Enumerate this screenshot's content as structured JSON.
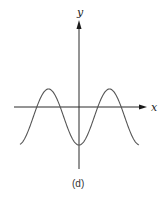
{
  "chart_data": {
    "type": "line",
    "title": "",
    "caption": "(d)",
    "xlabel": "x",
    "ylabel": "y",
    "grid": false,
    "legend": null,
    "series": [
      {
        "name": "y = -cos(x) shifted",
        "points_px": [
          [
            20,
            145
          ],
          [
            47,
            89
          ],
          [
            79,
            145
          ],
          [
            108,
            89
          ],
          [
            139,
            145
          ]
        ],
        "shape": "y = c - a*cos(x), minimum at x=0"
      }
    ],
    "pixel_geometry": {
      "y_axis_x": 79,
      "y_axis_top": 20,
      "y_axis_bottom": 169,
      "x_axis_y": 107,
      "x_axis_left": 14,
      "x_axis_right": 147,
      "wave_center_y": 117,
      "wave_amplitude": 28,
      "wave_period": 61
    }
  },
  "labels": {
    "x_axis": "x",
    "y_axis": "y",
    "caption": "(d)"
  },
  "colors": {
    "axis": "#2a2a2a",
    "curve": "#555555",
    "text": "#222222"
  }
}
